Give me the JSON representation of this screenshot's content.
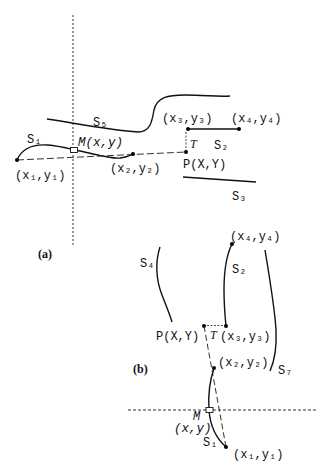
{
  "figure_a": {
    "caption": "(a)",
    "labels": {
      "s1": "S₁",
      "s2": "S₂",
      "s3": "S₃",
      "s5": "S₅",
      "m_point": "M(x,y)",
      "p_point": "P(X,Y)",
      "t": "T",
      "pt1": "(x₁,y₁)",
      "pt2": "(x₂,y₂)",
      "pt3": "(x₃,y₃)",
      "pt4": "(x₄,y₄)"
    }
  },
  "figure_b": {
    "caption": "(b)",
    "labels": {
      "s1": "S₁",
      "s2": "S₂",
      "s4": "S₄",
      "s7": "S₇",
      "m": "M",
      "m_coords": "(x,y)",
      "p_point": "P(X,Y)",
      "t": "T",
      "pt1": "(x₁,y₁)",
      "pt2": "(x₂,y₂)",
      "pt3": "(x₃,y₃)",
      "pt4": "(x₄,y₄)"
    }
  },
  "colors": {
    "ink": "#111111",
    "background": "#ffffff"
  }
}
